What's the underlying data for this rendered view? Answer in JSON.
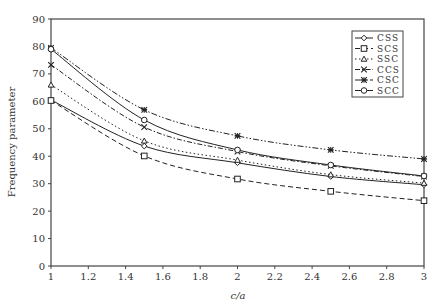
{
  "chart_data": {
    "type": "line",
    "title": "",
    "xlabel": "c/a",
    "ylabel": "Frequency parameter",
    "xlim": [
      1,
      3
    ],
    "ylim": [
      0,
      90
    ],
    "xticks": [
      1,
      1.2,
      1.4,
      1.6,
      1.8,
      2,
      2.2,
      2.4,
      2.6,
      2.8,
      3
    ],
    "xtick_labels": [
      "1",
      "1.2",
      "1.4",
      "1.6",
      "1.8",
      "2",
      "2.2",
      "2.4",
      "2.6",
      "2.8",
      "3"
    ],
    "yticks": [
      0,
      10,
      20,
      30,
      40,
      50,
      60,
      70,
      80,
      90
    ],
    "ytick_labels": [
      "0",
      "10",
      "20",
      "30",
      "40",
      "50",
      "60",
      "70",
      "80",
      "90"
    ],
    "grid": false,
    "legend_position": "top-right",
    "x": [
      1,
      1.5,
      2,
      2.5,
      3
    ],
    "series": [
      {
        "name": "CSS",
        "line": "solid",
        "marker": "diamond",
        "values": [
          60.5,
          43.7,
          37.6,
          32.6,
          29.6
        ]
      },
      {
        "name": "SCS",
        "line": "dashed",
        "marker": "square",
        "values": [
          60.3,
          40.1,
          31.7,
          27.2,
          23.8
        ]
      },
      {
        "name": "SSC",
        "line": "dotted",
        "marker": "triangle",
        "values": [
          66.0,
          45.6,
          38.6,
          33.3,
          30.2
        ]
      },
      {
        "name": "CCS",
        "line": "dashdot",
        "marker": "x",
        "values": [
          73.3,
          50.6,
          41.7,
          36.5,
          32.6
        ]
      },
      {
        "name": "CSC",
        "line": "dashdotdot",
        "marker": "asterisk",
        "values": [
          79.5,
          56.9,
          47.4,
          42.3,
          39.0
        ]
      },
      {
        "name": "SCC",
        "line": "solid",
        "marker": "circle",
        "values": [
          79.0,
          53.2,
          42.3,
          36.8,
          32.8
        ]
      }
    ]
  }
}
